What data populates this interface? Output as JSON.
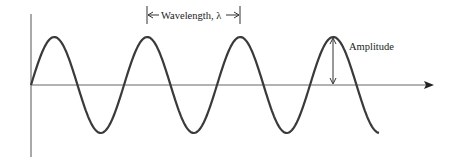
{
  "diagram": {
    "labels": {
      "wavelength": "Wavelength, λ",
      "amplitude": "Amplitude"
    },
    "colors": {
      "wave": "#3a3a3a",
      "axis": "#555555",
      "text": "#222222"
    },
    "geometry": {
      "origin": [
        31,
        85
      ],
      "amplitude_px": 48,
      "wavelength_px": 93,
      "cycles": 3.75
    }
  }
}
